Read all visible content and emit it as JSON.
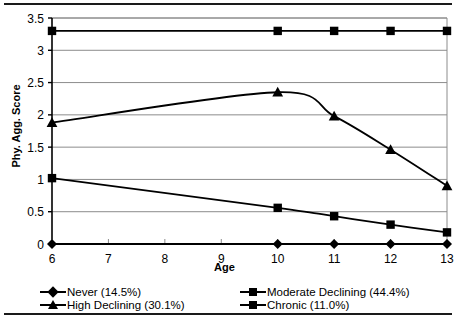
{
  "chart_data": {
    "type": "line",
    "title": "",
    "xlabel": "Age",
    "ylabel": "Phy. Agg. Score",
    "x": [
      6,
      7,
      8,
      9,
      10,
      11,
      12,
      13
    ],
    "xtick_labels": [
      "6",
      "7",
      "8",
      "9",
      "10",
      "11",
      "12",
      "13"
    ],
    "ytick_labels": [
      "0",
      "0.5",
      "1",
      "1.5",
      "2",
      "2.5",
      "3",
      "3.5"
    ],
    "ytick_values": [
      0,
      0.5,
      1,
      1.5,
      2,
      2.5,
      3,
      3.5
    ],
    "xlim": [
      6,
      13
    ],
    "ylim": [
      0,
      3.5
    ],
    "grid": "horizontal",
    "legend_position": "bottom",
    "marker_x": [
      6,
      10,
      11,
      12,
      13
    ],
    "series": [
      {
        "name": "Never (14.5%)",
        "short_name": "Never",
        "percent": "14.5%",
        "marker": "diamond",
        "x": [
          6,
          10,
          11,
          12,
          13
        ],
        "values": [
          0.0,
          0.0,
          0.0,
          0.0,
          0.0
        ]
      },
      {
        "name": "High Declining (30.1%)",
        "short_name": "High Declining",
        "percent": "30.1%",
        "marker": "triangle",
        "x": [
          6,
          10,
          11,
          12,
          13
        ],
        "values": [
          1.88,
          2.35,
          1.98,
          1.46,
          0.9
        ]
      },
      {
        "name": "Moderate Declining (44.4%)",
        "short_name": "Moderate Declining",
        "percent": "44.4%",
        "marker": "square",
        "x": [
          6,
          10,
          11,
          12,
          13
        ],
        "values": [
          1.02,
          0.56,
          0.43,
          0.3,
          0.18
        ]
      },
      {
        "name": "Chronic (11.0%)",
        "short_name": "Chronic",
        "percent": "11.0%",
        "marker": "square",
        "x": [
          6,
          10,
          11,
          12,
          13
        ],
        "values": [
          3.3,
          3.3,
          3.3,
          3.3,
          3.3
        ]
      }
    ],
    "colors": {
      "line": "#000000",
      "marker": "#000000",
      "grid": "#8c8c8c",
      "axis": "#000000",
      "background": "#ffffff"
    }
  },
  "legend": {
    "entries": [
      {
        "label": "Never (14.5%)",
        "marker": "diamond",
        "column": "left"
      },
      {
        "label": "High Declining (30.1%)",
        "marker": "triangle",
        "column": "left"
      },
      {
        "label": "Moderate Declining (44.4%)",
        "marker": "square",
        "column": "right"
      },
      {
        "label": "Chronic (11.0%)",
        "marker": "square",
        "column": "right"
      }
    ]
  },
  "axes": {
    "y_title": "Phy. Agg. Score",
    "x_title": "Age"
  }
}
